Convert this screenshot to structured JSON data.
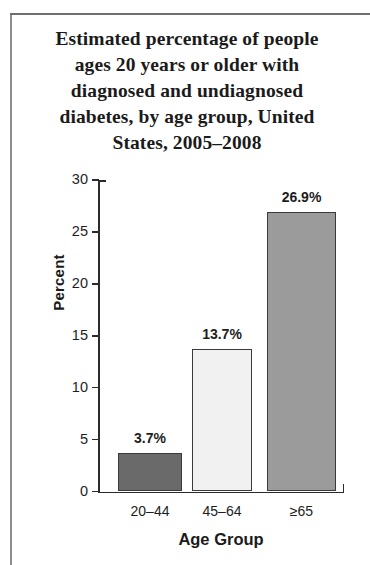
{
  "figure": {
    "title": [
      "Estimated percentage of people",
      "ages 20 years or older with",
      "diagnosed and undiagnosed",
      "diabetes, by age group, United",
      "States, 2005–2008"
    ]
  },
  "chart_data": {
    "type": "bar",
    "title": "Estimated percentage of people ages 20 years or older with diagnosed and undiagnosed diabetes, by age group, United States, 2005–2008",
    "xlabel": "Age Group",
    "ylabel": "Percent",
    "categories": [
      "20–44",
      "45–64",
      "≥65"
    ],
    "values": [
      3.7,
      13.7,
      26.9
    ],
    "data_labels": [
      "3.7%",
      "13.7%",
      "26.9%"
    ],
    "ylim": [
      0,
      30
    ],
    "yticks": [
      0,
      5,
      10,
      15,
      20,
      25,
      30
    ],
    "ytick_labels": [
      "0",
      "5",
      "10",
      "15",
      "20",
      "25",
      "30"
    ],
    "grid": false,
    "legend": null,
    "bar_colors": [
      "#6a6a6a",
      "#f1f1f1",
      "#9b9b9b"
    ],
    "bar_edge_color": "#3a3a3a"
  }
}
